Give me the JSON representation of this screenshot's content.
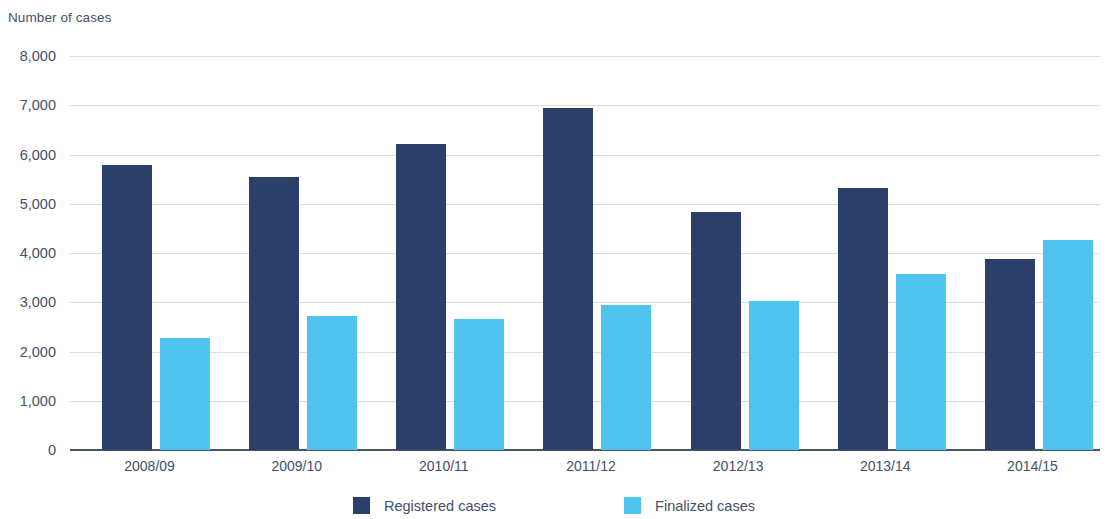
{
  "chart_data": {
    "type": "bar",
    "title": "",
    "xlabel": "",
    "ylabel": "Number of cases",
    "ylim": [
      0,
      8000
    ],
    "ytick_labels": [
      "8,000",
      "7,000",
      "6,000",
      "5,000",
      "4,000",
      "3,000",
      "2,000",
      "1,000",
      "0"
    ],
    "ytick_values": [
      8000,
      7000,
      6000,
      5000,
      4000,
      3000,
      2000,
      1000,
      0
    ],
    "grid": true,
    "legend_position": "bottom",
    "categories": [
      "2008/09",
      "2009/10",
      "2010/11",
      "2011/12",
      "2012/13",
      "2013/14",
      "2014/15"
    ],
    "series": [
      {
        "name": "Registered cases",
        "color": "#2b3f68",
        "values": [
          5780,
          5550,
          6220,
          6940,
          4830,
          5320,
          3870
        ]
      },
      {
        "name": "Finalized cases",
        "color": "#4ec3f0",
        "values": [
          2280,
          2720,
          2670,
          2940,
          3020,
          3580,
          4270
        ]
      }
    ]
  },
  "legend": {
    "items": [
      {
        "label": "Registered cases",
        "color": "#2b3f68"
      },
      {
        "label": "Finalized cases",
        "color": "#4ec3f0"
      }
    ]
  }
}
